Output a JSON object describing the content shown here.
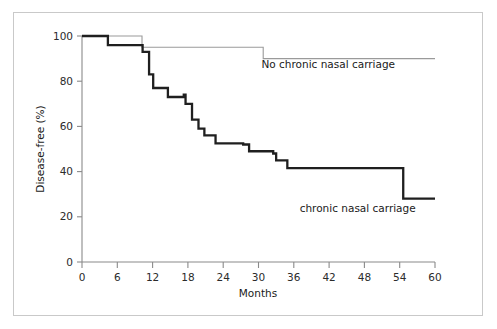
{
  "figure": {
    "background_color": "#ffffff",
    "frame_color": "#c9c9c9",
    "axis_color": "#8a8a8a"
  },
  "chart_data": {
    "type": "line",
    "subtype": "kaplan-meier-step",
    "title": "",
    "subtitle": "",
    "xlabel": "Months",
    "ylabel": "Disease-free (%)",
    "xlim": [
      0,
      60
    ],
    "ylim": [
      0,
      100
    ],
    "xticks": [
      0,
      6,
      12,
      18,
      24,
      30,
      36,
      42,
      48,
      54,
      60
    ],
    "xtick_labels": [
      "0",
      "6",
      "12",
      "18",
      "24",
      "30",
      "36",
      "42",
      "48",
      "54",
      "60"
    ],
    "yticks": [
      0,
      20,
      40,
      60,
      80,
      100
    ],
    "ytick_labels": [
      "0",
      "20",
      "40",
      "60",
      "80",
      "100"
    ],
    "grid": false,
    "legend_position": "inline-annotation",
    "series": [
      {
        "name": "No chronic nasal carriage",
        "color": "#9a9a9a",
        "line_width": 1.1,
        "label_x": 30.5,
        "label_y": 86,
        "steps": [
          {
            "x": 0.0,
            "y": 100
          },
          {
            "x": 10.2,
            "y": 100
          },
          {
            "x": 10.2,
            "y": 95
          },
          {
            "x": 30.8,
            "y": 95
          },
          {
            "x": 30.8,
            "y": 90
          },
          {
            "x": 60.0,
            "y": 90
          }
        ]
      },
      {
        "name": "chronic nasal carriage",
        "color": "#1f1f1f",
        "line_width": 2.3,
        "label_x": 37.0,
        "label_y": 22,
        "steps": [
          {
            "x": 0.0,
            "y": 100
          },
          {
            "x": 4.4,
            "y": 100
          },
          {
            "x": 4.4,
            "y": 96
          },
          {
            "x": 10.3,
            "y": 96
          },
          {
            "x": 10.3,
            "y": 93
          },
          {
            "x": 11.4,
            "y": 93
          },
          {
            "x": 11.4,
            "y": 83
          },
          {
            "x": 12.1,
            "y": 83
          },
          {
            "x": 12.1,
            "y": 77
          },
          {
            "x": 14.6,
            "y": 77
          },
          {
            "x": 14.6,
            "y": 73
          },
          {
            "x": 17.3,
            "y": 73
          },
          {
            "x": 17.3,
            "y": 74
          },
          {
            "x": 17.6,
            "y": 74
          },
          {
            "x": 17.6,
            "y": 70
          },
          {
            "x": 18.7,
            "y": 70
          },
          {
            "x": 18.7,
            "y": 63
          },
          {
            "x": 19.8,
            "y": 63
          },
          {
            "x": 19.8,
            "y": 59
          },
          {
            "x": 20.8,
            "y": 59
          },
          {
            "x": 20.8,
            "y": 56
          },
          {
            "x": 22.7,
            "y": 56
          },
          {
            "x": 22.7,
            "y": 52.5
          },
          {
            "x": 27.4,
            "y": 52.5
          },
          {
            "x": 27.4,
            "y": 52
          },
          {
            "x": 28.4,
            "y": 52
          },
          {
            "x": 28.4,
            "y": 49
          },
          {
            "x": 32.5,
            "y": 49
          },
          {
            "x": 32.5,
            "y": 48
          },
          {
            "x": 33.0,
            "y": 48
          },
          {
            "x": 33.0,
            "y": 45
          },
          {
            "x": 34.9,
            "y": 45
          },
          {
            "x": 34.9,
            "y": 41.5
          },
          {
            "x": 54.6,
            "y": 41.5
          },
          {
            "x": 54.6,
            "y": 28
          },
          {
            "x": 60.0,
            "y": 28
          }
        ]
      }
    ]
  }
}
